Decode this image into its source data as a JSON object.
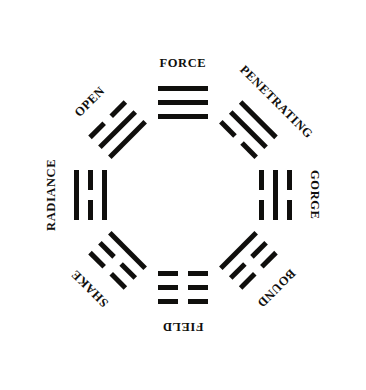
{
  "diagram": {
    "arrangement": "eight trigrams arranged around a circle",
    "ink_color": "#100f0d",
    "background_color": "#ffffff",
    "center_x": 183,
    "center_y": 197,
    "glyph_radius": 92,
    "label_radius": 132
  },
  "trigrams": [
    {
      "name": "FORCE",
      "angle": 0,
      "label_rotation": 0,
      "glyph_rotation": 0,
      "lines": [
        "solid",
        "solid",
        "solid"
      ],
      "unicode": "☰"
    },
    {
      "name": "PENETRATING",
      "angle": 45,
      "label_rotation": 45,
      "glyph_rotation": 45,
      "lines": [
        "solid",
        "solid",
        "broken"
      ],
      "unicode": "☴"
    },
    {
      "name": "GORGE",
      "angle": 90,
      "label_rotation": 90,
      "glyph_rotation": 90,
      "lines": [
        "broken",
        "solid",
        "broken"
      ],
      "unicode": "☵"
    },
    {
      "name": "BOUND",
      "angle": 135,
      "label_rotation": 135,
      "glyph_rotation": 135,
      "lines": [
        "broken",
        "broken",
        "solid"
      ],
      "unicode": "☶"
    },
    {
      "name": "FIELD",
      "angle": 180,
      "label_rotation": 180,
      "glyph_rotation": 180,
      "lines": [
        "broken",
        "broken",
        "broken"
      ],
      "unicode": "☷"
    },
    {
      "name": "SHAKE",
      "angle": 225,
      "label_rotation": 225,
      "glyph_rotation": 225,
      "lines": [
        "broken",
        "broken",
        "solid"
      ],
      "unicode": "☳"
    },
    {
      "name": "RADIANCE",
      "angle": 270,
      "label_rotation": 270,
      "glyph_rotation": 270,
      "lines": [
        "solid",
        "broken",
        "solid"
      ],
      "unicode": "☲"
    },
    {
      "name": "OPEN",
      "angle": 315,
      "label_rotation": 315,
      "glyph_rotation": 315,
      "lines": [
        "broken",
        "solid",
        "solid"
      ],
      "unicode": "☱"
    }
  ]
}
